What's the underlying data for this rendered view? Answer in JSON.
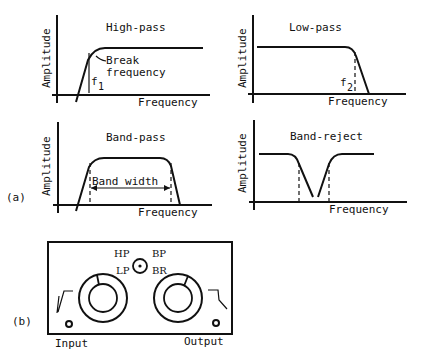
{
  "figure": {
    "part_a_label": "(a)",
    "part_b_label": "(b)",
    "axis_x_label": "Frequency",
    "axis_y_label": "Amplitude"
  },
  "panels": [
    {
      "id": "high-pass",
      "title": "High-pass",
      "annotation": "Break frequency",
      "annotation_line1": "Break",
      "annotation_line2": "frequency",
      "marker": "f",
      "marker_sub": "1"
    },
    {
      "id": "low-pass",
      "title": "Low-pass",
      "marker": "f",
      "marker_sub": "2"
    },
    {
      "id": "band-pass",
      "title": "Band-pass",
      "annotation": "Band width"
    },
    {
      "id": "band-reject",
      "title": "Band-reject"
    }
  ],
  "device": {
    "selector_labels": {
      "hp": "HP",
      "bp": "BP",
      "lp": "LP",
      "br": "BR"
    },
    "input_label": "Input",
    "output_label": "Output"
  }
}
